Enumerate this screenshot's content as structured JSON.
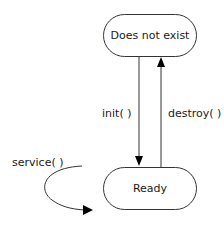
{
  "diagram": {
    "type": "state-diagram",
    "states": [
      {
        "id": "does-not-exist",
        "label": "Does not exist"
      },
      {
        "id": "ready",
        "label": "Ready"
      }
    ],
    "transitions": [
      {
        "from": "does-not-exist",
        "to": "ready",
        "label": "init( )"
      },
      {
        "from": "ready",
        "to": "does-not-exist",
        "label": "destroy( )"
      },
      {
        "from": "ready",
        "to": "ready",
        "label": "service( )"
      }
    ],
    "colors": {
      "stroke": "#333333",
      "text": "#1a1a1a",
      "background": "#ffffff"
    }
  }
}
